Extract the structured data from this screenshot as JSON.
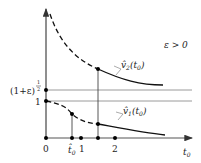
{
  "diagram": {
    "condition": "ε > 0",
    "y_labels": {
      "upper": "(1+ε)",
      "upper_exp_num": "1",
      "upper_exp_den": "2",
      "lower": "1"
    },
    "x_labels": {
      "origin": "0",
      "t_hat": "t̂",
      "t_hat_sub": "0",
      "one": "1",
      "two": "2",
      "axis": "t",
      "axis_sub": "0"
    },
    "curves": {
      "upper": {
        "name": "v̂",
        "sub": "2",
        "arg": "(t",
        "arg_sub": "0",
        "arg_close": ")"
      },
      "lower": {
        "name": "v̂",
        "sub": "1",
        "arg": "(t",
        "arg_sub": "0",
        "arg_close": ")"
      }
    },
    "colors": {
      "curve": "#111111",
      "axis": "#333333",
      "guide": "#999999"
    }
  }
}
